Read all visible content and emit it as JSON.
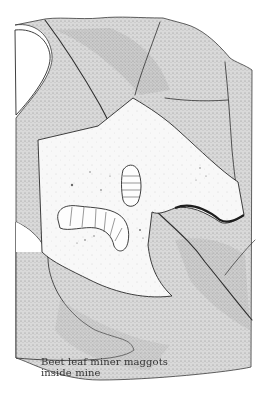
{
  "figure": {
    "style": "stippled pen-and-ink illustration",
    "colors": {
      "background": "#ffffff",
      "leaf_shade": "#d4d4d4",
      "leaf_shade_dark": "#a8a8a8",
      "mine_interior": "#f7f7f7",
      "ink": "#2a2a2a"
    }
  },
  "caption": {
    "line1": "Beet leaf miner maggots",
    "line2": "inside mine"
  }
}
